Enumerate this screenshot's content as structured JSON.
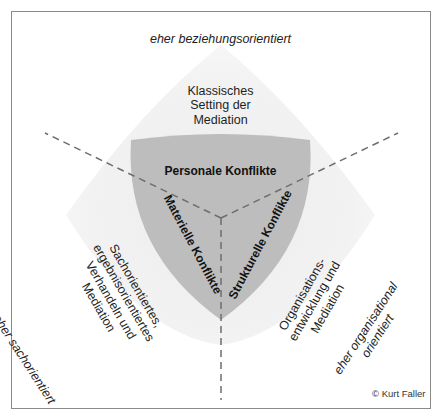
{
  "diagram": {
    "orientations": {
      "top": "eher beziehungsorientiert",
      "left": "eher sachorientiert",
      "right_line1": "eher organisational",
      "right_line2": "orientiert"
    },
    "outer_regions": {
      "top": [
        "Klassisches",
        "Setting der",
        "Mediation"
      ],
      "left": [
        "Sachorientiertes,",
        "ergebnisorientiertes",
        "Verhandeln und",
        "Mediation"
      ],
      "right": [
        "Organisations-",
        "entwicklung und",
        "Mediation"
      ]
    },
    "inner_conflicts": {
      "top": "Personale Konflikte",
      "left": "Materielle Konflikte",
      "right": "Strukturelle Konflikte"
    },
    "copyright": "© Kurt Faller",
    "colors": {
      "frame": "#8a8a8a",
      "outer_shape": "#f1f1f1",
      "inner_shape": "#bdbdbd",
      "dashed_lines": "#6e6e6e"
    }
  }
}
